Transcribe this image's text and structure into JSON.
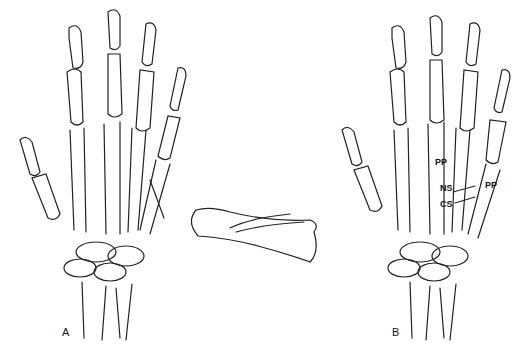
{
  "figure": {
    "panels": [
      {
        "id": "A",
        "label": "A",
        "description": "Dorsal view of right hand skeleton with oblique metacarpal fracture"
      },
      {
        "id": "B",
        "label": "B",
        "description": "Dorsal view of hand skeleton with labeled pin/screw fixation"
      }
    ],
    "center_detail": "Isolated metacarpal with oblique fracture line",
    "annotations": {
      "pp_left": "PP",
      "pp_right": "PP",
      "ns": "NS",
      "cs": "CS"
    }
  }
}
